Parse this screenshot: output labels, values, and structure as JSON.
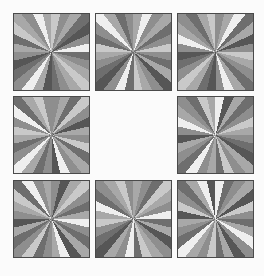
{
  "puzzle": {
    "rows": 3,
    "cols": 3,
    "background": "#fbfbfb",
    "border_color": "#4a4a4a",
    "missing_cell": {
      "row": 1,
      "col": 1
    },
    "palette": {
      "w": "#efefef",
      "l": "#c9c9c9",
      "m": "#a8a8a8",
      "g": "#8e8e8e",
      "d": "#6e6e6e",
      "k": "#565656"
    },
    "tiles": [
      {
        "row": 0,
        "col": 0,
        "x": 13,
        "y": 13,
        "rays": [
          "l",
          "g",
          "m",
          "d",
          "k",
          "g",
          "w",
          "d",
          "g",
          "m",
          "l",
          "m",
          "g",
          "d",
          "k",
          "m",
          "w",
          "g",
          "d",
          "k",
          "g",
          "m",
          "d",
          "l",
          "m",
          "g",
          "w",
          "m"
        ]
      },
      {
        "row": 0,
        "col": 1,
        "x": 95,
        "y": 13,
        "rays": [
          "m",
          "w",
          "g",
          "m",
          "d",
          "g",
          "l",
          "g",
          "d",
          "m",
          "k",
          "g",
          "m",
          "l",
          "d",
          "w",
          "g",
          "k",
          "d",
          "g",
          "m",
          "l",
          "d",
          "g",
          "w",
          "m",
          "d",
          "g"
        ]
      },
      {
        "row": 0,
        "col": 2,
        "x": 177,
        "y": 13,
        "rays": [
          "g",
          "m",
          "w",
          "d",
          "m",
          "k",
          "g",
          "l",
          "m",
          "g",
          "d",
          "m",
          "w",
          "g",
          "k",
          "d",
          "m",
          "l",
          "g",
          "d",
          "k",
          "g",
          "w",
          "m",
          "g",
          "d",
          "m",
          "l"
        ]
      },
      {
        "row": 1,
        "col": 0,
        "x": 13,
        "y": 96,
        "rays": [
          "g",
          "m",
          "d",
          "l",
          "g",
          "k",
          "m",
          "g",
          "l",
          "d",
          "m",
          "g",
          "w",
          "k",
          "g",
          "d",
          "m",
          "w",
          "g",
          "d",
          "m",
          "l",
          "g",
          "w",
          "d",
          "m",
          "l",
          "g"
        ]
      },
      {
        "row": 1,
        "col": 2,
        "x": 177,
        "y": 96,
        "rays": [
          "w",
          "k",
          "m",
          "d",
          "g",
          "l",
          "m",
          "g",
          "d",
          "k",
          "m",
          "g",
          "l",
          "d",
          "m",
          "g",
          "w",
          "d",
          "g",
          "m",
          "k",
          "g",
          "w",
          "m",
          "g",
          "d",
          "l",
          "m"
        ]
      },
      {
        "row": 2,
        "col": 0,
        "x": 13,
        "y": 180,
        "rays": [
          "g",
          "k",
          "m",
          "l",
          "g",
          "d",
          "m",
          "w",
          "g",
          "d",
          "m",
          "k",
          "w",
          "m",
          "g",
          "d",
          "l",
          "g",
          "d",
          "m",
          "k",
          "g",
          "m",
          "l",
          "d",
          "w",
          "g",
          "m"
        ]
      },
      {
        "row": 2,
        "col": 1,
        "x": 95,
        "y": 180,
        "rays": [
          "m",
          "g",
          "d",
          "l",
          "m",
          "g",
          "w",
          "d",
          "m",
          "k",
          "g",
          "m",
          "l",
          "d",
          "w",
          "g",
          "m",
          "k",
          "d",
          "g",
          "l",
          "m",
          "w",
          "d",
          "g",
          "m",
          "l",
          "g"
        ]
      },
      {
        "row": 2,
        "col": 2,
        "x": 177,
        "y": 180,
        "rays": [
          "w",
          "d",
          "g",
          "m",
          "k",
          "l",
          "g",
          "d",
          "m",
          "w",
          "g",
          "k",
          "m",
          "d",
          "l",
          "g",
          "m",
          "w",
          "d",
          "g",
          "m",
          "k",
          "l",
          "g",
          "d",
          "m",
          "w",
          "k"
        ]
      }
    ]
  }
}
